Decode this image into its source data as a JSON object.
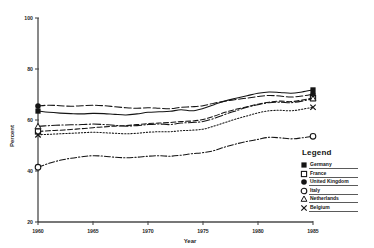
{
  "chart_data": {
    "type": "line",
    "title": "",
    "xlabel": "Year",
    "ylabel": "Percent",
    "xlim": [
      1960,
      1985
    ],
    "ylim": [
      20,
      100
    ],
    "grid": false,
    "legend_position": "right-bottom",
    "legend_title": "Legend",
    "x_ticks": [
      "1960",
      "1965",
      "1970",
      "1975",
      "1980",
      "1985"
    ],
    "y_ticks": [
      "100",
      "80",
      "60",
      "40",
      "20"
    ],
    "x": [
      1960,
      1961,
      1962,
      1963,
      1964,
      1965,
      1966,
      1967,
      1968,
      1969,
      1970,
      1971,
      1972,
      1973,
      1974,
      1975,
      1976,
      1977,
      1978,
      1979,
      1980,
      1981,
      1982,
      1983,
      1984,
      1985
    ],
    "series": [
      {
        "name": "Germany",
        "marker": "filled-square",
        "line_style": "solid",
        "values": [
          63.5,
          63.0,
          62.7,
          62.5,
          62.4,
          62.6,
          62.5,
          62.2,
          62.0,
          62.4,
          63.0,
          63.2,
          63.4,
          64.0,
          63.6,
          64.5,
          66.0,
          67.5,
          68.5,
          69.5,
          70.5,
          71.0,
          70.8,
          70.5,
          71.0,
          71.8
        ]
      },
      {
        "name": "France",
        "marker": "open-square",
        "line_style": "dashed",
        "values": [
          55.5,
          55.8,
          56.0,
          56.3,
          56.6,
          57.0,
          57.3,
          57.6,
          57.8,
          58.2,
          58.6,
          58.8,
          59.0,
          59.4,
          59.6,
          60.2,
          61.5,
          63.0,
          64.2,
          65.2,
          66.2,
          67.0,
          67.4,
          67.2,
          67.8,
          68.6
        ]
      },
      {
        "name": "United Kingdom",
        "marker": "filled-circle",
        "line_style": "long-dash",
        "values": [
          65.5,
          65.8,
          65.6,
          65.4,
          65.6,
          65.8,
          65.6,
          65.2,
          64.8,
          64.6,
          64.8,
          64.6,
          64.4,
          65.0,
          65.2,
          65.6,
          66.6,
          67.4,
          68.0,
          68.6,
          69.2,
          69.6,
          69.4,
          69.0,
          69.4,
          70.2
        ]
      },
      {
        "name": "Italy",
        "marker": "open-circle",
        "line_style": "dash-dot",
        "values": [
          41.5,
          43.0,
          44.2,
          45.0,
          45.6,
          46.0,
          45.8,
          45.4,
          45.2,
          45.4,
          45.8,
          46.0,
          45.8,
          46.2,
          46.8,
          47.2,
          48.0,
          49.4,
          50.6,
          51.6,
          52.4,
          53.2,
          53.0,
          52.6,
          53.0,
          53.6
        ]
      },
      {
        "name": "Netherlands",
        "marker": "open-triangle",
        "line_style": "dash-dot-long",
        "values": [
          57.5,
          57.8,
          58.0,
          58.1,
          58.2,
          58.4,
          58.2,
          57.9,
          57.6,
          57.8,
          58.2,
          58.4,
          58.2,
          58.8,
          59.0,
          59.4,
          60.6,
          62.2,
          63.6,
          65.0,
          66.0,
          66.8,
          67.0,
          66.8,
          67.4,
          68.4
        ]
      },
      {
        "name": "Belgium",
        "marker": "x",
        "line_style": "dotted",
        "values": [
          54.2,
          54.4,
          54.6,
          54.8,
          55.0,
          55.2,
          55.0,
          54.8,
          54.6,
          54.8,
          55.2,
          55.4,
          55.4,
          55.8,
          56.0,
          56.4,
          57.6,
          59.0,
          60.4,
          61.6,
          62.8,
          63.6,
          63.8,
          63.6,
          64.2,
          65.0
        ]
      }
    ]
  },
  "legend": {
    "title": "Legend",
    "items": [
      {
        "label": "Germany",
        "marker": "filled-square"
      },
      {
        "label": "France",
        "marker": "open-square"
      },
      {
        "label": "United Kingdom",
        "marker": "filled-circle"
      },
      {
        "label": "Italy",
        "marker": "open-circle"
      },
      {
        "label": "Netherlands",
        "marker": "open-triangle"
      },
      {
        "label": "Belgium",
        "marker": "x"
      }
    ]
  },
  "axes": {
    "y_title": "Percent",
    "x_title": "Year"
  }
}
